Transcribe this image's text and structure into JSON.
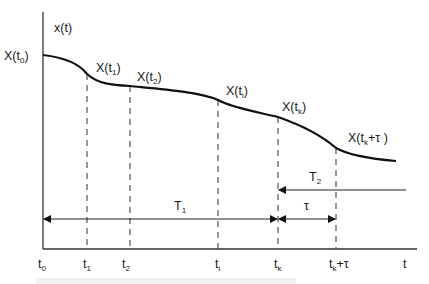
{
  "diagram": {
    "y_axis_label": "x(t)",
    "x_axis_label": "t",
    "points": [
      {
        "name": "X",
        "sub": "0",
        "paren": "t",
        "label_text": "X(t0)",
        "x": 43,
        "y": 55
      },
      {
        "name": "X",
        "sub": "1",
        "paren": "t",
        "label_text": "X(t1)",
        "x": 87,
        "y": 74
      },
      {
        "name": "X",
        "sub": "2",
        "paren": "t",
        "label_text": "X(t2)",
        "x": 130,
        "y": 86
      },
      {
        "name": "X",
        "sub": "i",
        "paren": "t",
        "label_text": "X(ti)",
        "x": 218,
        "y": 100
      },
      {
        "name": "X",
        "sub": "k",
        "paren": "t",
        "label_text": "X(tk)",
        "x": 278,
        "y": 117
      },
      {
        "name": "X",
        "sub": "k",
        "paren": "t",
        "suffix": "+τ",
        "label_text": "X(tk+τ)",
        "x": 336,
        "y": 148
      }
    ],
    "ticks": [
      {
        "base": "t",
        "sub": "0",
        "suffix": "",
        "x": 43
      },
      {
        "base": "t",
        "sub": "1",
        "suffix": "",
        "x": 87
      },
      {
        "base": "t",
        "sub": "2",
        "suffix": "",
        "x": 130
      },
      {
        "base": "t",
        "sub": "i",
        "suffix": "",
        "x": 218
      },
      {
        "base": "t",
        "sub": "k",
        "suffix": "",
        "x": 278
      },
      {
        "base": "t",
        "sub": "k",
        "suffix": "+τ",
        "x": 336
      }
    ],
    "intervals": {
      "T1": {
        "base": "T",
        "sub": "1",
        "from": "t0",
        "to": "tk"
      },
      "T2": {
        "base": "T",
        "sub": "2",
        "from": "∞",
        "to": "tk"
      },
      "tau": {
        "label": "τ",
        "from": "tk",
        "to": "tk+τ"
      }
    },
    "labels": {
      "x_t0": {
        "X": "X(t",
        "sub": "0",
        "close": ")"
      },
      "x_t1": {
        "X": "X(t",
        "sub": "1",
        "close": ")"
      },
      "x_t2": {
        "X": "X(t",
        "sub": "2",
        "close": ")"
      },
      "x_ti": {
        "X": "X(t",
        "sub": "i",
        "close": ")"
      },
      "x_tk": {
        "X": "X(t",
        "sub": "k",
        "close": ")"
      },
      "x_tktau": {
        "X": "X(t",
        "sub": "k",
        "close": "+τ )"
      },
      "tick_t0": {
        "base": "t",
        "sub": "0"
      },
      "tick_t1": {
        "base": "t",
        "sub": "1"
      },
      "tick_t2": {
        "base": "t",
        "sub": "2"
      },
      "tick_ti": {
        "base": "t",
        "sub": "i"
      },
      "tick_tk": {
        "base": "t",
        "sub": "k"
      },
      "tick_tktau": {
        "base": "t",
        "sub": "k",
        "suffix": "+τ"
      },
      "T1": {
        "base": "T",
        "sub": "1"
      },
      "T2": {
        "base": "T",
        "sub": "2"
      },
      "tau": "τ",
      "t": "t",
      "xt": "x(t)"
    }
  }
}
